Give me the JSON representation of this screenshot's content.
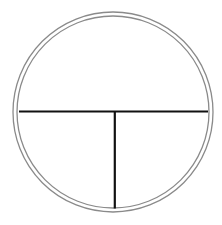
{
  "diagram": {
    "type": "circle-divided",
    "background": "#ffffff",
    "outer_circle": {
      "cx": 113,
      "cy": 112,
      "r": 100,
      "stroke": "#8a8a8a",
      "stroke_width": 1.3
    },
    "inner_circle": {
      "cx": 113,
      "cy": 112,
      "r": 96,
      "stroke": "#8a8a8a",
      "stroke_width": 1.3
    },
    "horizontal_line": {
      "x1": 19,
      "y1": 111.5,
      "x2": 208,
      "y2": 111.5,
      "stroke": "#111111",
      "stroke_width": 2.2
    },
    "vertical_line": {
      "x1": 114.8,
      "y1": 111.5,
      "x2": 114.8,
      "y2": 208.5,
      "stroke": "#111111",
      "stroke_width": 2.2
    }
  }
}
